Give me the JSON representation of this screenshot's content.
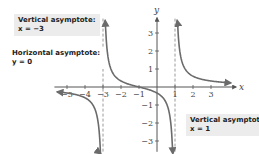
{
  "chart_data": {
    "type": "line",
    "title": "",
    "function_description": "rational function with vertical asymptotes x = -3 and x = 1, horizontal asymptote y = 0",
    "xlabel": "x",
    "ylabel": "y",
    "xlim": [
      -5.5,
      4.2
    ],
    "ylim": [
      -3.6,
      3.8
    ],
    "x_ticks": [
      -5,
      -4,
      -3,
      -2,
      -1,
      1,
      2,
      3
    ],
    "x_tick_labels": [
      "-5",
      "-4",
      "-3",
      "-2",
      "-1",
      "1",
      "2",
      "3"
    ],
    "y_ticks": [
      -3,
      -2,
      -1,
      1,
      2,
      3
    ],
    "y_tick_labels": [
      "-3",
      "-2",
      "-1",
      "1",
      "2",
      "3"
    ],
    "grid": false,
    "asymptotes": {
      "vertical": [
        -3,
        1
      ],
      "horizontal": [
        0
      ]
    },
    "series": [
      {
        "name": "left branch",
        "x": [
          -5.5,
          -5,
          -4.5,
          -4,
          -3.5,
          -3.2
        ],
        "y": [
          -0.3,
          -0.33,
          -0.41,
          -0.6,
          -1.11,
          -2.6
        ]
      },
      {
        "name": "middle branch",
        "x": [
          -2.8,
          -2.5,
          -2,
          -1.5,
          -1,
          -0.5,
          0,
          0.5,
          0.8
        ],
        "y": [
          2.6,
          0.86,
          0.33,
          0.13,
          0,
          -0.13,
          -0.33,
          -0.57,
          -2.0
        ]
      },
      {
        "name": "right branch",
        "x": [
          1.2,
          1.5,
          2,
          2.5,
          3,
          3.5,
          4
        ],
        "y": [
          2.6,
          1.11,
          0.6,
          0.41,
          0.33,
          0.28,
          0.24
        ]
      }
    ],
    "annotations": [
      {
        "title": "Vertical asymptote:",
        "equation": "x = −3"
      },
      {
        "title": "Horizontal asymptote:",
        "equation": "y = 0"
      },
      {
        "title": "Vertical asymptote:",
        "equation": "x = 1"
      }
    ]
  },
  "labels": {
    "va_left_title": "Vertical asymptote:",
    "va_left_eq": "x = −3",
    "ha_title": "Horizontal asymptote:",
    "ha_eq": "y = 0",
    "va_right_title": "Vertical asymptote:",
    "va_right_eq": "x = 1",
    "x_axis": "x",
    "y_axis": "y"
  },
  "colors": {
    "curve": "#6b6b6b",
    "asymptote": "#9a9a9a",
    "axis": "#555555",
    "callout_bg": "#ececec"
  }
}
